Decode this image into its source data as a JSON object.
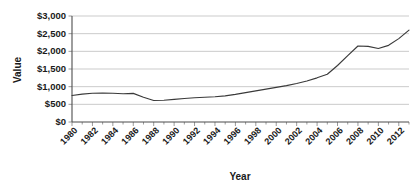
{
  "chart_data": {
    "type": "line",
    "title": "",
    "xlabel": "Year",
    "ylabel": "Value",
    "grid": true,
    "legend": "none",
    "xlim": [
      1980,
      2013
    ],
    "ylim": [
      0,
      3000
    ],
    "ytick_labels": [
      "$0",
      "$500",
      "$1,000",
      "$1,500",
      "$2,000",
      "$2,500",
      "$3,000"
    ],
    "ytick_values": [
      0,
      500,
      1000,
      1500,
      2000,
      2500,
      3000
    ],
    "xtick_labels": [
      "1980",
      "1982",
      "1984",
      "1986",
      "1988",
      "1990",
      "1992",
      "1994",
      "1996",
      "1998",
      "2000",
      "2002",
      "2004",
      "2006",
      "2008",
      "2010",
      "2012"
    ],
    "xtick_values": [
      1980,
      1982,
      1984,
      1986,
      1988,
      1990,
      1992,
      1994,
      1996,
      1998,
      2000,
      2002,
      2004,
      2006,
      2008,
      2010,
      2012
    ],
    "x": [
      1980,
      1981,
      1982,
      1983,
      1984,
      1985,
      1986,
      1987,
      1988,
      1989,
      1990,
      1991,
      1992,
      1993,
      1994,
      1995,
      1996,
      1997,
      1998,
      1999,
      2000,
      2001,
      2002,
      2003,
      2004,
      2005,
      2006,
      2007,
      2008,
      2009,
      2010,
      2011,
      2012,
      2013
    ],
    "values": [
      750,
      790,
      815,
      820,
      815,
      800,
      810,
      700,
      610,
      615,
      640,
      665,
      685,
      700,
      715,
      740,
      780,
      830,
      880,
      930,
      980,
      1030,
      1090,
      1160,
      1250,
      1350,
      1600,
      1880,
      2150,
      2140,
      2080,
      2170,
      2360,
      2600
    ],
    "series_name": "Value",
    "line_color": "#3a3a3a",
    "grid_color": "#b5b5b5",
    "axis_color": "#4d4d4d"
  },
  "axes": {
    "y_title": "Value",
    "x_title": "Year"
  }
}
